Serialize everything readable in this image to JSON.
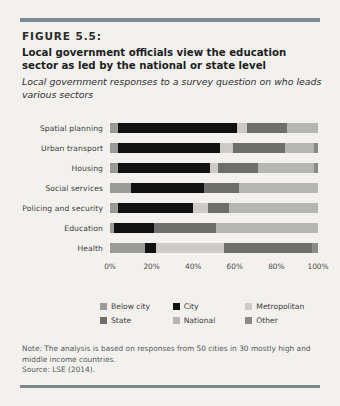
{
  "figure": {
    "number": "FIGURE 5.5:",
    "title": "Local government officials view the education sector as led by the national or state level",
    "subtitle": "Local government responses to a survey question on who leads various sectors"
  },
  "notes": {
    "note": "Note: The analysis is based on responses from 50 cities in 30 mostly high and middle income countries.",
    "source": "Source: LSE (2014)."
  },
  "legend": {
    "items": [
      {
        "label": "Below city",
        "color": "#9a9a99"
      },
      {
        "label": "City",
        "color": "#121212"
      },
      {
        "label": "Metropolitan",
        "color": "#cccbc8"
      },
      {
        "label": "State",
        "color": "#6e6e6d"
      },
      {
        "label": "National",
        "color": "#b5b5b3"
      },
      {
        "label": "Other",
        "color": "#8a8a89"
      }
    ]
  },
  "chart_data": {
    "type": "bar",
    "orientation": "horizontal",
    "stacked": true,
    "normalized_percent": true,
    "title": "Local government officials view the education sector as led by the national or state level",
    "subtitle": "Local government responses to a survey question on who leads various sectors",
    "xlabel": "",
    "ylabel": "",
    "xlim": [
      0,
      100
    ],
    "xticks": [
      0,
      20,
      40,
      60,
      80,
      100
    ],
    "xticklabels": [
      "0%",
      "20%",
      "40%",
      "60%",
      "80%",
      "100%"
    ],
    "grid": false,
    "legend_position": "bottom",
    "categories": [
      "Spatial planning",
      "Urban transport",
      "Housing",
      "Social services",
      "Policing and security",
      "Education",
      "Health"
    ],
    "series": [
      {
        "name": "Below city",
        "color": "#9a9a99",
        "values": [
          4,
          4,
          4,
          10,
          4,
          2,
          17
        ]
      },
      {
        "name": "City",
        "color": "#121212",
        "values": [
          57,
          49,
          44,
          35,
          36,
          19,
          5
        ]
      },
      {
        "name": "Metropolitan",
        "color": "#cccbc8",
        "values": [
          5,
          6,
          4,
          0,
          7,
          0,
          33
        ]
      },
      {
        "name": "State",
        "color": "#6e6e6d",
        "values": [
          19,
          25,
          19,
          17,
          10,
          30,
          42
        ]
      },
      {
        "name": "National",
        "color": "#b5b5b3",
        "values": [
          15,
          14,
          27,
          38,
          43,
          49,
          0
        ]
      },
      {
        "name": "Other",
        "color": "#8a8a89",
        "values": [
          0,
          2,
          2,
          0,
          0,
          0,
          3
        ]
      }
    ]
  }
}
